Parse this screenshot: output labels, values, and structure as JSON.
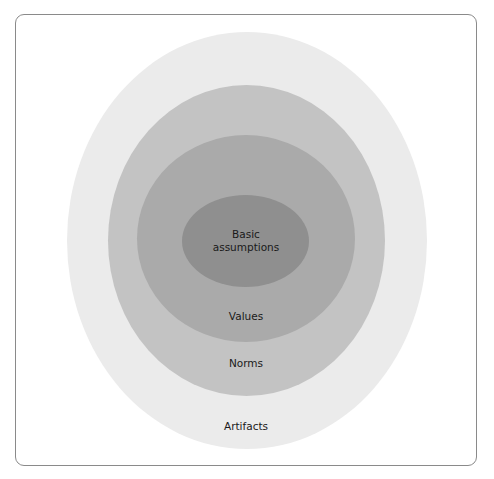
{
  "diagram": {
    "type": "nested-ellipses",
    "layers": [
      {
        "id": "artifacts",
        "label": "Artifacts",
        "color": "#ebebeb"
      },
      {
        "id": "norms",
        "label": "Norms",
        "color": "#c3c3c3"
      },
      {
        "id": "values",
        "label": "Values",
        "color": "#aaaaaa"
      },
      {
        "id": "basic",
        "label": "Basic\nassumptions",
        "label_lines": [
          "Basic",
          "assumptions"
        ],
        "color": "#8f8f8f"
      }
    ],
    "frame_border_color": "#8a8a8a"
  }
}
